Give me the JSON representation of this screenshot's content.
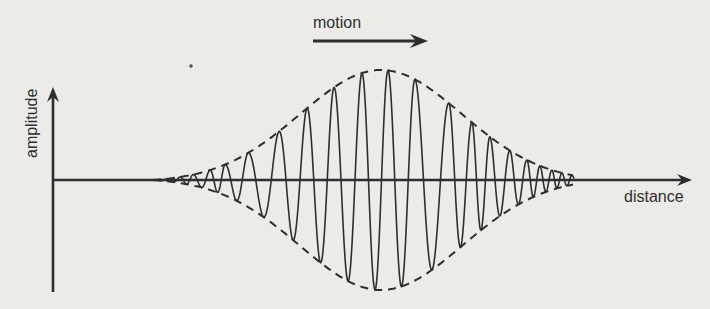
{
  "labels": {
    "motion": "motion",
    "x_axis": "distance",
    "y_axis": "amplitude"
  },
  "colors": {
    "background": "#ecebe8",
    "ink": "#2e2e2e"
  },
  "geometry": {
    "origin_x": 53,
    "axis_y": 180,
    "y_axis_top": 87,
    "y_axis_bottom": 292,
    "x_axis_end": 692,
    "motion_arrow": {
      "x1": 313,
      "x2": 428,
      "y": 41
    }
  },
  "wave_packet": {
    "envelope": {
      "start_x": 153,
      "end_x": 574,
      "center_x": 381,
      "top_y": 70,
      "bottom_y": 290,
      "style": "dashed"
    },
    "crest_x": [
      180,
      193,
      210,
      225,
      248,
      279,
      307,
      334,
      362,
      388,
      415,
      449,
      472,
      490,
      510,
      527,
      540,
      552,
      562
    ],
    "description": "wave packet (group) moving right along distance axis; carrier oscillation inside a bell-shaped dashed envelope"
  }
}
